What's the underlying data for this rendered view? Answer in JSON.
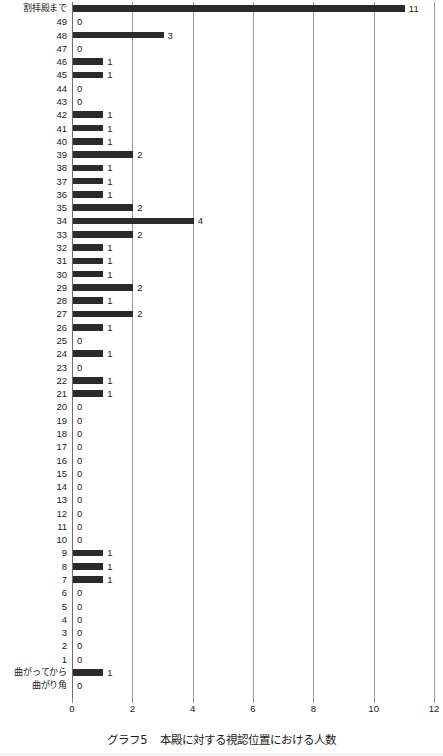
{
  "caption": {
    "number": "グラフ5",
    "title": "本殿に対する視認位置における人数"
  },
  "chart_data": {
    "type": "bar",
    "orientation": "horizontal",
    "xlabel": "",
    "ylabel": "",
    "xlim": [
      0,
      12
    ],
    "xticks": [
      0,
      2,
      4,
      6,
      8,
      10,
      12
    ],
    "xticklabels": [
      "0",
      "2",
      "4",
      "6",
      "8",
      "10",
      "12"
    ],
    "grid": true,
    "legend": null,
    "show_value_labels": true,
    "categories": [
      "割拝殿まで",
      "49",
      "48",
      "47",
      "46",
      "45",
      "44",
      "43",
      "42",
      "41",
      "40",
      "39",
      "38",
      "37",
      "36",
      "35",
      "34",
      "33",
      "32",
      "31",
      "30",
      "29",
      "28",
      "27",
      "26",
      "25",
      "24",
      "23",
      "22",
      "21",
      "20",
      "19",
      "18",
      "17",
      "16",
      "15",
      "14",
      "13",
      "12",
      "11",
      "10",
      "9",
      "8",
      "7",
      "6",
      "5",
      "4",
      "3",
      "2",
      "1",
      "曲がってから",
      "曲がり角"
    ],
    "values": [
      11,
      0,
      3,
      0,
      1,
      1,
      0,
      0,
      1,
      1,
      1,
      2,
      1,
      1,
      1,
      2,
      4,
      2,
      1,
      1,
      1,
      2,
      1,
      2,
      1,
      0,
      1,
      0,
      1,
      1,
      0,
      0,
      0,
      0,
      0,
      0,
      0,
      0,
      0,
      0,
      0,
      1,
      1,
      1,
      0,
      0,
      0,
      0,
      0,
      0,
      1,
      0
    ]
  },
  "style": {
    "bar_color": "#2b2b2b",
    "gridline_color": "#9a9a9a",
    "text_color": "#222222",
    "background": "#ffffff"
  }
}
